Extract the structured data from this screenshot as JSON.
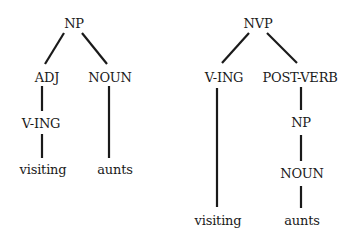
{
  "diagram": {
    "type": "syntax-trees",
    "trees": [
      {
        "id": "left",
        "root": "NP",
        "nodes": {
          "root": "NP",
          "adj": "ADJ",
          "noun": "NOUN",
          "ving": "V-ING",
          "word1": "visiting",
          "word2": "aunts"
        },
        "edges": [
          [
            "NP",
            "ADJ"
          ],
          [
            "NP",
            "NOUN"
          ],
          [
            "ADJ",
            "V-ING"
          ],
          [
            "V-ING",
            "visiting"
          ],
          [
            "NOUN",
            "aunts"
          ]
        ]
      },
      {
        "id": "right",
        "root": "NVP",
        "nodes": {
          "root": "NVP",
          "ving": "V-ING",
          "postverb": "POST-VERB",
          "np": "NP",
          "noun": "NOUN",
          "word1": "visiting",
          "word2": "aunts"
        },
        "edges": [
          [
            "NVP",
            "V-ING"
          ],
          [
            "NVP",
            "POST-VERB"
          ],
          [
            "POST-VERB",
            "NP"
          ],
          [
            "NP",
            "NOUN"
          ],
          [
            "V-ING",
            "visiting"
          ],
          [
            "NOUN",
            "aunts"
          ]
        ]
      }
    ],
    "colors": {
      "ink": "#1a1a1a",
      "background": "#ffffff"
    }
  }
}
